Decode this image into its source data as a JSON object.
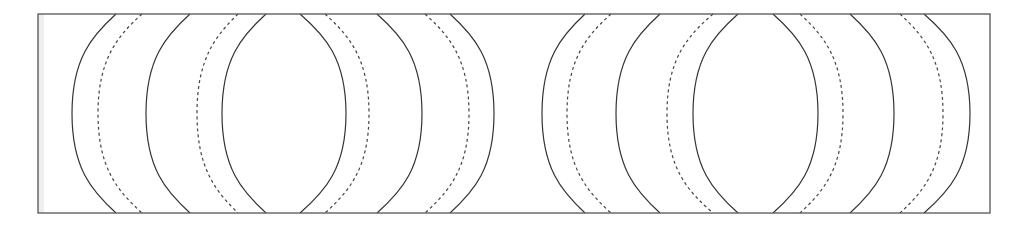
{
  "canvas": {
    "width": 1027,
    "height": 230,
    "background": "#ffffff"
  },
  "frame": {
    "x": 38,
    "y": 14,
    "width": 952,
    "height": 199,
    "stroke": "#555555",
    "stroke_width": 1.3,
    "inner_shade": {
      "width": 6,
      "color": "#eeeeee"
    }
  },
  "style": {
    "solid_stroke": "#333333",
    "dashed_stroke": "#444444",
    "stroke_width": 1.2,
    "dash_pattern": "3,3"
  },
  "groups": [
    {
      "name": "left-block-left-bulging",
      "arcs": [
        {
          "kind": "solid",
          "x_edge": 116,
          "x_mid": 72
        },
        {
          "kind": "dashed",
          "x_edge": 142,
          "x_mid": 98
        },
        {
          "kind": "solid",
          "x_edge": 190,
          "x_mid": 146
        },
        {
          "kind": "dashed",
          "x_edge": 238,
          "x_mid": 197
        },
        {
          "kind": "solid",
          "x_edge": 266,
          "x_mid": 222
        }
      ]
    },
    {
      "name": "left-block-right-bulging",
      "arcs": [
        {
          "kind": "solid",
          "x_edge": 300,
          "x_mid": 346
        },
        {
          "kind": "dashed",
          "x_edge": 325,
          "x_mid": 369
        },
        {
          "kind": "solid",
          "x_edge": 377,
          "x_mid": 422
        },
        {
          "kind": "dashed",
          "x_edge": 425,
          "x_mid": 469
        },
        {
          "kind": "solid",
          "x_edge": 450,
          "x_mid": 494
        }
      ]
    },
    {
      "name": "right-block-left-bulging",
      "arcs": [
        {
          "kind": "solid",
          "x_edge": 585,
          "x_mid": 542
        },
        {
          "kind": "dashed",
          "x_edge": 611,
          "x_mid": 567
        },
        {
          "kind": "solid",
          "x_edge": 660,
          "x_mid": 616
        },
        {
          "kind": "dashed",
          "x_edge": 713,
          "x_mid": 667
        },
        {
          "kind": "solid",
          "x_edge": 738,
          "x_mid": 693
        }
      ]
    },
    {
      "name": "right-block-right-bulging",
      "arcs": [
        {
          "kind": "solid",
          "x_edge": 773,
          "x_mid": 818
        },
        {
          "kind": "dashed",
          "x_edge": 800,
          "x_mid": 843
        },
        {
          "kind": "solid",
          "x_edge": 850,
          "x_mid": 894
        },
        {
          "kind": "dashed",
          "x_edge": 900,
          "x_mid": 943
        },
        {
          "kind": "solid",
          "x_edge": 924,
          "x_mid": 970
        }
      ]
    }
  ]
}
